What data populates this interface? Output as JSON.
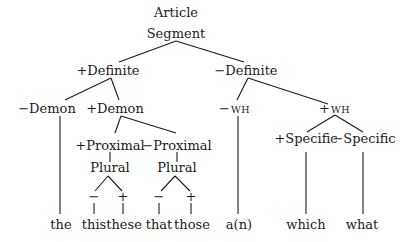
{
  "diagram": {
    "type": "tree",
    "nodes": {
      "root_line1": "Article",
      "root_line2": "Segment",
      "plus_definite": "+Definite",
      "minus_definite": "−Definite",
      "minus_demon": "−Demon",
      "plus_demon": "+Demon",
      "plus_proximal": "+Proximal",
      "minus_proximal": "−Proximal",
      "plural_1": "Plural",
      "plural_2": "Plural",
      "plural_1_minus": "−",
      "plural_1_plus": "+",
      "plural_2_minus": "−",
      "plural_2_plus": "+",
      "minus_wh_sign": "−",
      "minus_wh": "WH",
      "plus_wh_sign": "+",
      "plus_wh": "WH",
      "plus_specific": "+Specific",
      "minus_specific": "−Specific"
    },
    "leaves": {
      "the": "the",
      "this": "this",
      "these": "these",
      "that": "that",
      "those": "those",
      "a_n": "a(n)",
      "which": "which",
      "what": "what"
    },
    "edges": [
      [
        "Article Segment",
        "+Definite"
      ],
      [
        "Article Segment",
        "−Definite"
      ],
      [
        "+Definite",
        "−Demon"
      ],
      [
        "+Definite",
        "+Demon"
      ],
      [
        "−Demon",
        "the"
      ],
      [
        "+Demon",
        "+Proximal"
      ],
      [
        "+Demon",
        "−Proximal"
      ],
      [
        "+Proximal",
        "Plural"
      ],
      [
        "−Proximal",
        "Plural"
      ],
      [
        "Plural(+Proximal)",
        "− → this"
      ],
      [
        "Plural(+Proximal)",
        "+ → these"
      ],
      [
        "Plural(−Proximal)",
        "− → that"
      ],
      [
        "Plural(−Proximal)",
        "+ → those"
      ],
      [
        "−Definite",
        "−WH"
      ],
      [
        "−Definite",
        "+WH"
      ],
      [
        "−WH",
        "a(n)"
      ],
      [
        "+WH",
        "+Specific"
      ],
      [
        "+WH",
        "−Specific"
      ],
      [
        "+Specific",
        "which"
      ],
      [
        "−Specific",
        "what"
      ]
    ]
  }
}
